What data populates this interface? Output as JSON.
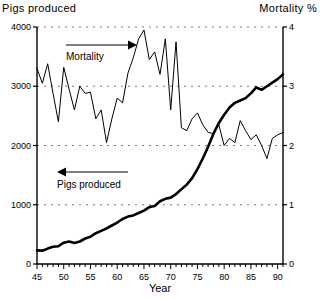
{
  "header": {
    "left_title": "Pigs produced",
    "right_title": "Mortality %"
  },
  "chart_data": {
    "type": "line",
    "title": "",
    "xlabel": "Year",
    "ylabel": "Pigs produced",
    "y2label": "Mortality %",
    "xlim": [
      45,
      91
    ],
    "ylim": [
      0,
      4000
    ],
    "y2lim": [
      0,
      4
    ],
    "grid": true,
    "grid_orientation": "horizontal",
    "grid_style": "dashed",
    "legend": "none",
    "xticks": [
      45,
      50,
      55,
      60,
      65,
      70,
      75,
      80,
      85,
      90
    ],
    "xticklabels": [
      "45",
      "50",
      "55",
      "60",
      "65",
      "70",
      "75",
      "80",
      "85",
      "90"
    ],
    "xminor_tick_step": 1,
    "yticks": [
      0,
      1000,
      2000,
      3000,
      4000
    ],
    "yticklabels": [
      "0",
      "1000",
      "2000",
      "3000",
      "4000"
    ],
    "y2ticks": [
      0,
      1,
      2,
      3,
      4
    ],
    "y2ticklabels": [
      "0",
      "1",
      "2",
      "3",
      "4"
    ],
    "annotations": [
      {
        "text": "Mortality",
        "arrow": "right",
        "points_to": "right-axis"
      },
      {
        "text": "Pigs produced",
        "arrow": "left",
        "points_to": "left-axis"
      }
    ],
    "x": [
      45,
      46,
      47,
      48,
      49,
      50,
      51,
      52,
      53,
      54,
      55,
      56,
      57,
      58,
      59,
      60,
      61,
      62,
      63,
      64,
      65,
      66,
      67,
      68,
      69,
      70,
      71,
      72,
      73,
      74,
      75,
      76,
      77,
      78,
      79,
      80,
      81,
      82,
      83,
      84,
      85,
      86,
      87,
      88,
      89,
      90,
      91
    ],
    "series": [
      {
        "name": "Mortality",
        "axis": "right",
        "units": "%",
        "line_width": "thin",
        "values": [
          3.3,
          3.05,
          3.38,
          2.88,
          2.4,
          3.32,
          2.95,
          2.6,
          3.0,
          2.88,
          2.9,
          2.45,
          2.6,
          2.05,
          2.45,
          2.8,
          2.72,
          3.22,
          3.48,
          3.8,
          3.95,
          3.45,
          3.58,
          3.2,
          3.8,
          2.6,
          3.75,
          2.3,
          2.25,
          2.45,
          2.55,
          2.35,
          2.22,
          2.2,
          2.35,
          2.0,
          2.12,
          2.05,
          2.42,
          2.25,
          2.1,
          2.18,
          2.0,
          1.78,
          2.12,
          2.18,
          2.22
        ]
      },
      {
        "name": "Pigs produced",
        "axis": "left",
        "units": "thousands",
        "line_width": "thick",
        "values": [
          230,
          225,
          260,
          290,
          300,
          360,
          380,
          355,
          380,
          430,
          460,
          520,
          560,
          600,
          650,
          700,
          760,
          800,
          820,
          860,
          900,
          960,
          980,
          1060,
          1100,
          1120,
          1180,
          1260,
          1340,
          1450,
          1600,
          1780,
          1980,
          2200,
          2380,
          2520,
          2640,
          2720,
          2760,
          2800,
          2880,
          2980,
          2940,
          3000,
          3060,
          3120,
          3200
        ]
      }
    ]
  }
}
